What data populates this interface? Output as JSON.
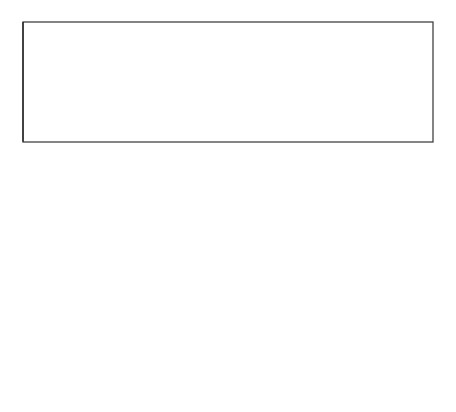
{
  "captions": [
    {
      "id": "mites",
      "text": "Mites, springtails, and insects eat holes into leaves; chemicals drain."
    },
    {
      "id": "bacteria",
      "text": "Bacteria and fungi feed on innards: leaves turn dark with bacteria."
    },
    {
      "id": "vegetation",
      "text": "Vegetation falls apart into bits of humus. Compounds leach out and mix with mineral soil."
    }
  ],
  "colors": {
    "line": "#1a1a1a",
    "soil": "#111111",
    "fungus_patch": "#777777",
    "background": "#ffffff"
  },
  "callouts": [
    {
      "id": "insects-callout",
      "description": "leaf with many small insects"
    },
    {
      "id": "fungi-callout",
      "description": "mushroom with dark leaf patches"
    },
    {
      "id": "humus-callout",
      "description": "cracked particles mixing with soil"
    }
  ]
}
